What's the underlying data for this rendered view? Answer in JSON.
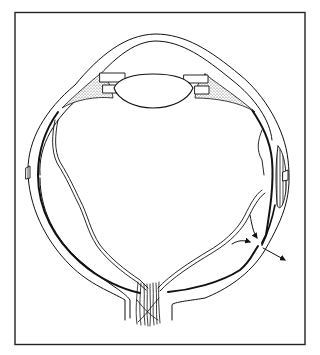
{
  "diagram": {
    "frame": {
      "x": 14,
      "y": 12,
      "width": 291,
      "height": 333,
      "stroke": "#222222"
    },
    "colors": {
      "line": "#111111",
      "background": "#ffffff",
      "stipple": "#777777"
    },
    "parts": [
      {
        "id": "cornea",
        "label": ""
      },
      {
        "id": "lens",
        "label": ""
      },
      {
        "id": "ciliary-body",
        "label": ""
      },
      {
        "id": "sclera",
        "label": ""
      },
      {
        "id": "choroid",
        "label": ""
      },
      {
        "id": "retina",
        "label": ""
      },
      {
        "id": "optic-nerve",
        "label": ""
      },
      {
        "id": "vortex-vein",
        "label": ""
      },
      {
        "id": "flow-arrows",
        "label": ""
      }
    ]
  }
}
